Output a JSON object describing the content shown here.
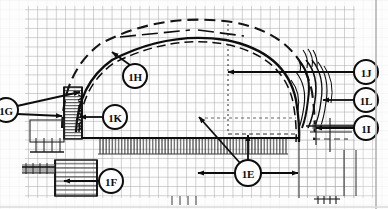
{
  "figure": {
    "background_color": "#fdfdfd",
    "line_color": "#0d0d0d",
    "grid_color": "#8f8f8f",
    "grid_color_light": "#c8c8c8",
    "border_color": "#b4b4b4",
    "width": 388,
    "height": 209
  },
  "callouts": [
    {
      "id": "1G",
      "label": "1G",
      "cx": 6,
      "cy": 110,
      "r": 12,
      "leaders": [
        {
          "x1": 17,
          "x2": 80,
          "y1": 106,
          "y2": 92
        },
        {
          "x1": 17,
          "x2": 62,
          "y1": 114,
          "y2": 116
        }
      ]
    },
    {
      "id": "1H",
      "label": "1H",
      "cx": 135,
      "cy": 76,
      "r": 12,
      "leaders": [
        {
          "x1": 130,
          "x2": 112,
          "y1": 65,
          "y2": 52
        }
      ]
    },
    {
      "id": "1K",
      "label": "1K",
      "cx": 115,
      "cy": 117,
      "r": 12,
      "leaders": [
        {
          "x1": 103,
          "x2": 80,
          "y1": 117,
          "y2": 117
        }
      ]
    },
    {
      "id": "1F",
      "label": "1F",
      "cx": 111,
      "cy": 181,
      "r": 12,
      "leaders": [
        {
          "x1": 99,
          "x2": 64,
          "y1": 181,
          "y2": 181
        }
      ]
    },
    {
      "id": "1E",
      "label": "1E",
      "cx": 248,
      "cy": 173,
      "r": 13,
      "leaders": [
        {
          "x1": 240,
          "x2": 199,
          "y1": 163,
          "y2": 117
        },
        {
          "x1": 248,
          "x2": 248,
          "y1": 160,
          "y2": 135
        },
        {
          "x1": 235,
          "x2": 198,
          "y1": 173,
          "y2": 173
        },
        {
          "x1": 261,
          "x2": 298,
          "y1": 173,
          "y2": 173
        }
      ]
    },
    {
      "id": "1J",
      "label": "1J",
      "cx": 366,
      "cy": 72,
      "r": 12,
      "leaders": [
        {
          "x1": 354,
          "x2": 228,
          "y1": 72,
          "y2": 72
        }
      ]
    },
    {
      "id": "1L",
      "label": "1L",
      "cx": 366,
      "cy": 100,
      "r": 12,
      "leaders": [
        {
          "x1": 354,
          "x2": 323,
          "y1": 100,
          "y2": 100
        }
      ]
    },
    {
      "id": "1I",
      "label": "1I",
      "cx": 366,
      "cy": 128,
      "r": 12,
      "leaders": [
        {
          "x1": 354,
          "x2": 316,
          "y1": 128,
          "y2": 128
        }
      ]
    }
  ],
  "structure": {
    "outer_dome_label": "outer-dome-arc",
    "inner_dome_label": "inner-dome-arc",
    "left_wall_label": "left-wall-hatching",
    "floor_band_label": "floor-hatched-band",
    "right_layers_label": "right-nested-layers",
    "foundation_label": "foundation-block",
    "centerline_label": "vertical-centerline"
  }
}
